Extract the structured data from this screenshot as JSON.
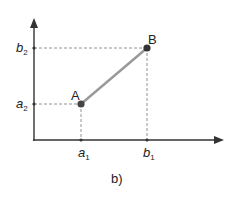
{
  "figure": {
    "caption": "b)",
    "points": {
      "A": {
        "label": "A",
        "x_label": "a",
        "x_sub": "1",
        "y_label": "a",
        "y_sub": "2"
      },
      "B": {
        "label": "B",
        "x_label": "b",
        "x_sub": "1",
        "y_label": "b",
        "y_sub": "2"
      }
    },
    "colors": {
      "axis": "#333333",
      "segment": "#999999",
      "point": "#333333",
      "guide": "#777777"
    }
  }
}
